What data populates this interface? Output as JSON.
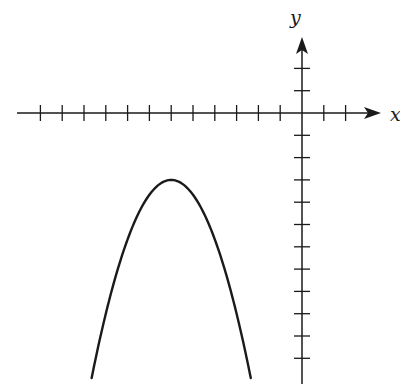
{
  "chart_data": {
    "type": "line",
    "title": "",
    "xlabel": "x",
    "ylabel": "y",
    "grid": false,
    "legend": null,
    "axis_ranges": {
      "x": [
        -13,
        3
      ],
      "y": [
        -12,
        3
      ]
    },
    "x_ticks": [
      -12,
      -11,
      -10,
      -9,
      -8,
      -7,
      -6,
      -5,
      -4,
      -3,
      -2,
      -1,
      1,
      2
    ],
    "y_ticks": [
      2,
      1,
      -1,
      -2,
      -3,
      -4,
      -5,
      -6,
      -7,
      -8,
      -9,
      -10,
      -11
    ],
    "tick_labels_shown": false,
    "series": [
      {
        "name": "parabola",
        "equation": "y = -(2/3)(x + 6)^2 - 3",
        "vertex": [
          -6,
          -3
        ],
        "opens": "down",
        "x_range": [
          -9.65,
          -2.35
        ],
        "points": [
          [
            -9.6,
            -11.64
          ],
          [
            -9,
            -9
          ],
          [
            -8,
            -5.67
          ],
          [
            -7,
            -3.67
          ],
          [
            -6,
            -3
          ],
          [
            -5,
            -3.67
          ],
          [
            -4,
            -5.67
          ],
          [
            -3,
            -9
          ],
          [
            -2.4,
            -11.64
          ]
        ]
      }
    ]
  },
  "labels": {
    "x_axis": "x",
    "y_axis": "y"
  },
  "colors": {
    "stroke": "#1a1a1a",
    "background": "#ffffff"
  }
}
